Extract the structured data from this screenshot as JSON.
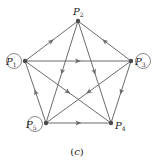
{
  "figure": {
    "caption": "(c)",
    "caption_letter": "c"
  },
  "graph": {
    "directed": true,
    "colors": {
      "edge": "#6b6b6b",
      "node": "#4a4a4a",
      "text": "#222222"
    },
    "nodes": [
      {
        "id": "P1",
        "base": "P",
        "sub": "1",
        "circled": true
      },
      {
        "id": "P2",
        "base": "P",
        "sub": "2",
        "circled": false
      },
      {
        "id": "P3",
        "base": "P",
        "sub": "3",
        "circled": true
      },
      {
        "id": "P4",
        "base": "P",
        "sub": "4",
        "circled": false
      },
      {
        "id": "P5",
        "base": "P",
        "sub": "5",
        "circled": true
      }
    ],
    "edges": [
      {
        "from": "P1",
        "to": "P2"
      },
      {
        "from": "P3",
        "to": "P2"
      },
      {
        "from": "P1",
        "to": "P3"
      },
      {
        "from": "P2",
        "to": "P5"
      },
      {
        "from": "P2",
        "to": "P4"
      },
      {
        "from": "P1",
        "to": "P4"
      },
      {
        "from": "P3",
        "to": "P5"
      },
      {
        "from": "P5",
        "to": "P1"
      },
      {
        "from": "P3",
        "to": "P4"
      },
      {
        "from": "P5",
        "to": "P4"
      }
    ]
  }
}
